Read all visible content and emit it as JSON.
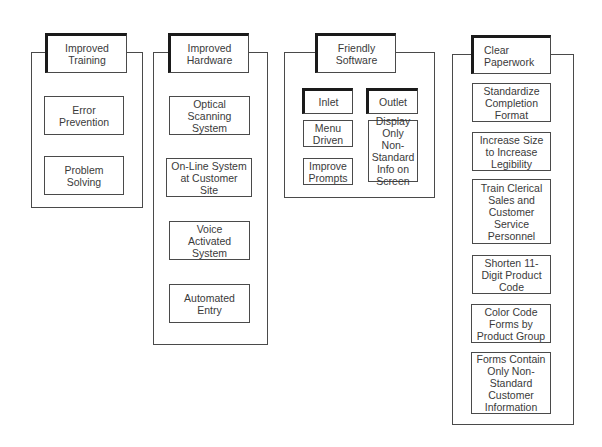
{
  "diagram": {
    "columns": [
      {
        "header": "Improved\nTraining",
        "items": [
          "Error\nPrevention",
          "Problem\nSolving"
        ]
      },
      {
        "header": "Improved\nHardware",
        "items": [
          "Optical\nScanning\nSystem",
          "On-Line System\nat Customer\nSite",
          "Voice\nActivated\nSystem",
          "Automated\nEntry"
        ]
      },
      {
        "header": "Friendly\nSoftware",
        "subgroups": [
          {
            "header": "Inlet",
            "items": [
              "Menu\nDriven",
              "Improve\nPrompts"
            ]
          },
          {
            "header": "Outlet",
            "items": [
              "Display\nOnly Non-\nStandard\nInfo on\nScreen"
            ]
          }
        ]
      },
      {
        "header": "Clear\nPaperwork",
        "items": [
          "Standardize\nCompletion\nFormat",
          "Increase Size\nto Increase\nLegibility",
          "Train Clerical\nSales and\nCustomer\nService\nPersonnel",
          "Shorten 11-\nDigit Product\nCode",
          "Color Code\nForms by\nProduct Group",
          "Forms Contain\nOnly Non-\nStandard\nCustomer\nInformation"
        ]
      }
    ]
  }
}
